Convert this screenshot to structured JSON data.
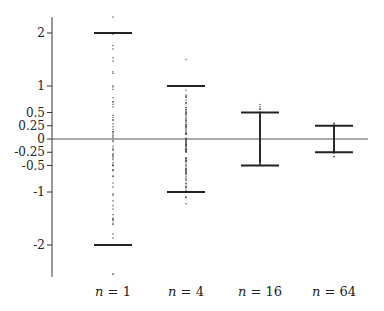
{
  "chart_data": {
    "type": "scatter",
    "title": "",
    "xlabel": "",
    "ylabel": "",
    "ylim": [
      -2.6,
      2.3
    ],
    "grid": false,
    "legend": null,
    "y_ticks": [
      {
        "value": 2,
        "label": "2"
      },
      {
        "value": 1,
        "label": "1"
      },
      {
        "value": 0.5,
        "label": "0.5"
      },
      {
        "value": 0.25,
        "label": "0.25"
      },
      {
        "value": 0,
        "label": "0"
      },
      {
        "value": -0.25,
        "label": "-0.25"
      },
      {
        "value": -0.5,
        "label": "-0.5"
      },
      {
        "value": -1,
        "label": "-1"
      },
      {
        "value": -2,
        "label": "-2"
      }
    ],
    "categories": [
      "n = 1",
      "n = 4",
      "n = 16",
      "n = 64"
    ],
    "series": [
      {
        "name": "n = 1",
        "n": 1,
        "bound_upper": 2,
        "bound_lower": -2,
        "data_min": -2.55,
        "data_max": 2.3
      },
      {
        "name": "n = 4",
        "n": 4,
        "bound_upper": 1,
        "bound_lower": -1,
        "data_min": -1.22,
        "data_max": 1.5
      },
      {
        "name": "n = 16",
        "n": 16,
        "bound_upper": 0.5,
        "bound_lower": -0.5,
        "data_min": -0.42,
        "data_max": 0.65
      },
      {
        "name": "n = 64",
        "n": 64,
        "bound_upper": 0.25,
        "bound_lower": -0.25,
        "data_min": -0.33,
        "data_max": 0.3
      }
    ],
    "annotations": [
      "Horizontal bars mark ±2/√n bounds; dots are sample values",
      "Horizontal reference line at y = 0"
    ]
  },
  "labels": {
    "n_symbol": "n",
    "eq": " = "
  }
}
